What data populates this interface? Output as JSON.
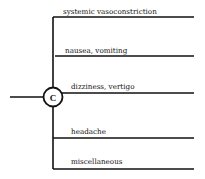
{
  "diagram": {
    "node": {
      "label": "C"
    },
    "branches": [
      {
        "label": "systemic vasoconstriction"
      },
      {
        "label": "nausea, vomiting"
      },
      {
        "label": "dizziness, vertigo"
      },
      {
        "label": "headache"
      },
      {
        "label": "miscellaneous"
      }
    ]
  }
}
